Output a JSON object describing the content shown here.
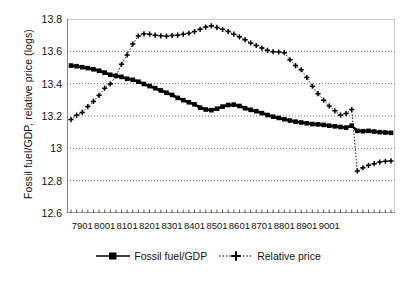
{
  "chart_data": {
    "type": "line",
    "title": "",
    "xlabel": "",
    "ylabel": "Fossil fuel/GDP, relative price (logs)",
    "ylim": [
      12.6,
      13.8
    ],
    "yticks": [
      "12.6",
      "12.8",
      "13",
      "13.2",
      "13.4",
      "13.6",
      "13.8"
    ],
    "ytick_values": [
      12.6,
      12.8,
      13.0,
      13.2,
      13.4,
      13.6,
      13.8
    ],
    "xticks": [
      "7901",
      "8001",
      "8101",
      "8201",
      "8301",
      "8401",
      "8501",
      "8601",
      "8701",
      "8801",
      "8901",
      "9001"
    ],
    "grid": true,
    "legend_position": "bottom",
    "x": [
      "7803",
      "7804",
      "7901",
      "7902",
      "7903",
      "7904",
      "8001",
      "8002",
      "8003",
      "8004",
      "8101",
      "8102",
      "8103",
      "8104",
      "8201",
      "8202",
      "8203",
      "8204",
      "8301",
      "8302",
      "8303",
      "8304",
      "8401",
      "8402",
      "8403",
      "8404",
      "8501",
      "8502",
      "8503",
      "8504",
      "8601",
      "8602",
      "8603",
      "8604",
      "8701",
      "8702",
      "8703",
      "8704",
      "8801",
      "8802",
      "8803",
      "8804",
      "8901",
      "8902",
      "8903",
      "8904",
      "9001",
      "9002",
      "9003"
    ],
    "series": [
      {
        "name": "Fossil fuel/GDP",
        "marker": "square",
        "linestyle": "solid",
        "color": "#000000",
        "values": [
          13.512,
          13.508,
          13.502,
          13.496,
          13.489,
          13.48,
          13.468,
          13.455,
          13.448,
          13.442,
          13.43,
          13.424,
          13.412,
          13.398,
          13.385,
          13.372,
          13.358,
          13.344,
          13.33,
          13.312,
          13.298,
          13.285,
          13.272,
          13.252,
          13.24,
          13.236,
          13.245,
          13.258,
          13.268,
          13.27,
          13.262,
          13.248,
          13.238,
          13.23,
          13.218,
          13.206,
          13.196,
          13.188,
          13.18,
          13.172,
          13.165,
          13.16,
          13.155,
          13.15,
          13.148,
          13.145,
          13.12,
          13.112,
          13.105
        ]
      },
      {
        "name": "Relative price",
        "marker": "plus",
        "linestyle": "dotted",
        "color": "#000000",
        "values": [
          13.178,
          13.205,
          13.222,
          13.258,
          13.29,
          13.328,
          13.372,
          13.398,
          13.448,
          13.52,
          13.578,
          13.645,
          13.695,
          13.708,
          13.706,
          13.7,
          13.696,
          13.694,
          13.698,
          13.7,
          13.706,
          13.712,
          13.722,
          13.736,
          13.75,
          13.758,
          13.748,
          13.736,
          13.722,
          13.706,
          13.69,
          13.672,
          13.652,
          13.636,
          13.62,
          13.606,
          13.598,
          13.596,
          13.592,
          13.548,
          13.512,
          13.486,
          13.438,
          13.384,
          13.338,
          13.298,
          13.262,
          13.232,
          13.205
        ]
      }
    ],
    "relative_price_full": [
      13.178,
      13.205,
      13.222,
      13.258,
      13.29,
      13.328,
      13.372,
      13.398,
      13.448,
      13.52,
      13.578,
      13.645,
      13.695,
      13.708,
      13.706,
      13.7,
      13.696,
      13.694,
      13.698,
      13.7,
      13.706,
      13.712,
      13.722,
      13.736,
      13.75,
      13.758,
      13.748,
      13.736,
      13.722,
      13.706,
      13.69,
      13.672,
      13.652,
      13.636,
      13.62,
      13.606,
      13.598,
      13.596,
      13.592,
      13.548,
      13.512,
      13.486,
      13.438,
      13.384,
      13.338,
      13.298,
      13.262,
      13.232,
      13.205,
      13.215,
      13.24,
      12.86,
      12.88,
      12.895,
      12.905,
      12.915,
      12.92,
      12.922
    ],
    "fossil_full": [
      13.512,
      13.508,
      13.502,
      13.496,
      13.489,
      13.48,
      13.468,
      13.455,
      13.448,
      13.442,
      13.43,
      13.424,
      13.412,
      13.398,
      13.385,
      13.372,
      13.358,
      13.344,
      13.33,
      13.312,
      13.298,
      13.285,
      13.272,
      13.252,
      13.24,
      13.236,
      13.245,
      13.258,
      13.268,
      13.27,
      13.262,
      13.248,
      13.238,
      13.23,
      13.218,
      13.206,
      13.196,
      13.188,
      13.18,
      13.172,
      13.165,
      13.16,
      13.155,
      13.15,
      13.148,
      13.145,
      13.14,
      13.136,
      13.132,
      13.128,
      13.14,
      13.108,
      13.106,
      13.108,
      13.104,
      13.1,
      13.098,
      13.096
    ]
  },
  "legend": {
    "items": [
      {
        "label": "Fossil fuel/GDP",
        "marker": "square-marker",
        "style": "solid"
      },
      {
        "label": "Relative price",
        "marker": "plus-marker",
        "style": "dotted"
      }
    ]
  }
}
